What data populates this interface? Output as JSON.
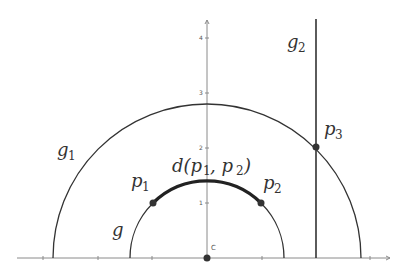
{
  "diagram": {
    "axis": {
      "y_ticks": [
        "1",
        "2",
        "3",
        "4"
      ],
      "origin_label": "C"
    },
    "labels": {
      "g": "g",
      "g1_base": "g",
      "g1_sub": "1",
      "g2_base": "g",
      "g2_sub": "2",
      "p1_base": "p",
      "p1_sub": "1",
      "p2_base": "p",
      "p2_sub": "2",
      "p3_base": "p",
      "p3_sub": "3",
      "distance": "d(p",
      "distance_sub1": "1",
      "distance_mid": ", p",
      "distance_sub2": "2",
      "distance_end": ")"
    },
    "colors": {
      "curve": "#333333",
      "axis": "#8a8a8a"
    }
  }
}
